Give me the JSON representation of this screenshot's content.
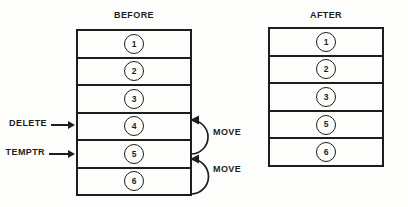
{
  "figure": {
    "background_color": "#fdfdfc",
    "ink_color": "#1d1d1d"
  },
  "before": {
    "title": "BEFORE",
    "items": [
      "1",
      "2",
      "3",
      "4",
      "5",
      "6"
    ],
    "pointers": [
      {
        "label": "DELETE",
        "points_to_item": "4"
      },
      {
        "label": "TEMPTR",
        "points_to_item": "5"
      }
    ],
    "moves": [
      {
        "label": "MOVE",
        "from_item": "5",
        "to_item": "4"
      },
      {
        "label": "MOVE",
        "from_item": "6",
        "to_item": "5"
      }
    ]
  },
  "after": {
    "title": "AFTER",
    "items": [
      "1",
      "2",
      "3",
      "5",
      "6"
    ]
  }
}
